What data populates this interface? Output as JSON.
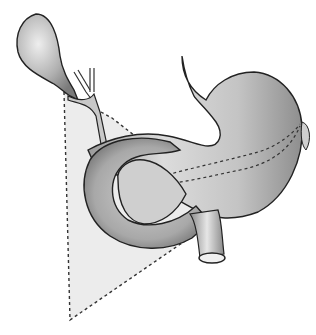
{
  "figure": {
    "subject": "Anatomical illustration of gallbladder, biliary ducts, stomach, duodenum and pancreas with dashed triangular region",
    "structures": [
      "gallbladder",
      "cystic-duct",
      "hepatic-ducts",
      "common-bile-duct",
      "esophagus",
      "stomach",
      "duodenum",
      "pancreas",
      "superior-mesenteric-vessel"
    ],
    "overlay": "dashed-triangle-region",
    "colors": {
      "background": "#ffffff",
      "organ_fill": "#b8b8b8",
      "organ_light": "#e2e2e2",
      "outline": "#222222",
      "region_fill": "#ececec",
      "dash": "#333333"
    }
  }
}
